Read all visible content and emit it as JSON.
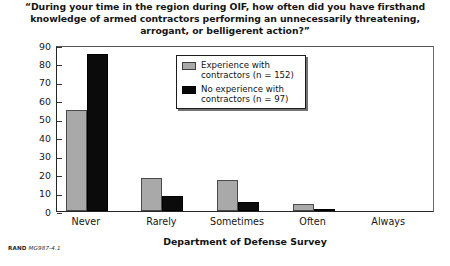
{
  "footer": {
    "source_prefix": "RAND",
    "source_id": "MG987-4.1"
  },
  "chart_data": {
    "type": "bar",
    "title": "“During your time in the region during OIF, how often did you have firsthand knowledge of armed contractors performing an unnecessarily threatening, arrogant, or belligerent action?”",
    "xlabel": "Department of Defense Survey",
    "ylabel": "Percentage",
    "categories": [
      "Never",
      "Rarely",
      "Sometimes",
      "Often",
      "Always"
    ],
    "series": [
      {
        "name": "Experience with contractors (n = 152)",
        "color": "#a9a9a9",
        "values": [
          55,
          18,
          17,
          4,
          0
        ]
      },
      {
        "name": "No experience with contractors (n = 97)",
        "color": "#0b0b0b",
        "values": [
          85,
          8,
          5,
          1,
          0
        ]
      }
    ],
    "ylim": [
      0,
      90
    ],
    "yticks": [
      0,
      10,
      20,
      30,
      40,
      50,
      60,
      70,
      80,
      90
    ],
    "ytick_labels": [
      "0",
      "10",
      "20",
      "30",
      "40",
      "50",
      "60",
      "70",
      "80",
      "90"
    ],
    "grid": false,
    "legend_position": "top-center"
  }
}
